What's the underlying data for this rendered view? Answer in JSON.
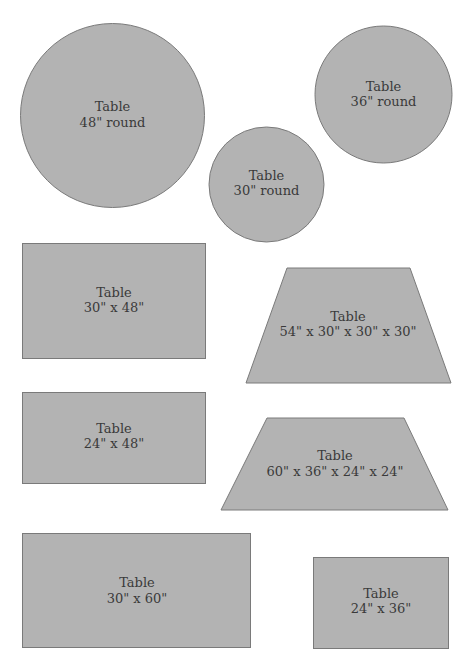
{
  "diagram": {
    "type": "table-shapes-template",
    "fill_color": "#b3b3b3",
    "stroke_color": "#7a7a7a",
    "text_color": "#3a3a3a",
    "tables": [
      {
        "id": "round-48",
        "shape": "circle",
        "title": "Table",
        "size": "48\" round"
      },
      {
        "id": "round-36",
        "shape": "circle",
        "title": "Table",
        "size": "36\" round"
      },
      {
        "id": "round-30",
        "shape": "circle",
        "title": "Table",
        "size": "30\" round"
      },
      {
        "id": "rect-30x48",
        "shape": "rectangle",
        "title": "Table",
        "size": "30\" x 48\""
      },
      {
        "id": "trap-54",
        "shape": "trapezoid",
        "title": "Table",
        "size": "54\" x 30\" x 30\" x 30\""
      },
      {
        "id": "rect-24x48",
        "shape": "rectangle",
        "title": "Table",
        "size": "24\" x 48\""
      },
      {
        "id": "trap-60",
        "shape": "trapezoid",
        "title": "Table",
        "size": "60\" x 36\" x 24\" x 24\""
      },
      {
        "id": "rect-30x60",
        "shape": "rectangle",
        "title": "Table",
        "size": "30\" x 60\""
      },
      {
        "id": "rect-24x36",
        "shape": "rectangle",
        "title": "Table",
        "size": "24\" x 36\""
      }
    ]
  }
}
